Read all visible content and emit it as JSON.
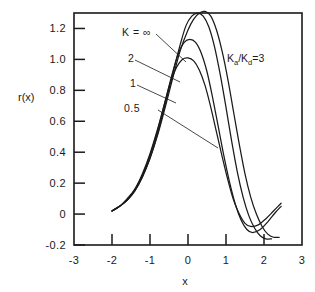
{
  "chart_data": {
    "type": "line",
    "title": "",
    "xlabel": "x",
    "ylabel": "r(x)",
    "xlim": [
      -3,
      3
    ],
    "ylim": [
      -0.2,
      1.3
    ],
    "grid": false,
    "legend_position": "inline-annotations",
    "x_ticks": [
      "-3",
      "-2",
      "-1",
      "0",
      "1",
      "2",
      "3"
    ],
    "x_tick_values": [
      -3,
      -2,
      -1,
      0,
      1,
      2,
      3
    ],
    "y_ticks": [
      "1.2",
      "1.0",
      "0.8",
      "0.6",
      "0.4",
      "0.2",
      "0",
      "-0.2"
    ],
    "y_tick_values": [
      1.2,
      1.0,
      0.8,
      0.6,
      0.4,
      0.2,
      0,
      -0.2
    ],
    "annotations": [
      {
        "name": "ratio",
        "text": "Ka/Kd =3",
        "x": 1.55,
        "y": 1.03
      }
    ],
    "series": [
      {
        "name": "K = ∞",
        "label": "K = ∞",
        "points": [
          [
            -2.0,
            0.02
          ],
          [
            -1.8,
            0.05
          ],
          [
            -1.6,
            0.09
          ],
          [
            -1.4,
            0.15
          ],
          [
            -1.2,
            0.24
          ],
          [
            -1.0,
            0.36
          ],
          [
            -0.8,
            0.51
          ],
          [
            -0.6,
            0.69
          ],
          [
            -0.4,
            0.88
          ],
          [
            -0.2,
            1.06
          ],
          [
            0.0,
            1.19
          ],
          [
            0.15,
            1.26
          ],
          [
            0.3,
            1.3
          ],
          [
            0.45,
            1.31
          ],
          [
            0.6,
            1.28
          ],
          [
            0.75,
            1.19
          ],
          [
            0.9,
            1.05
          ],
          [
            1.05,
            0.87
          ],
          [
            1.2,
            0.66
          ],
          [
            1.35,
            0.45
          ],
          [
            1.5,
            0.26
          ],
          [
            1.65,
            0.11
          ],
          [
            1.8,
            0.0
          ],
          [
            1.95,
            -0.08
          ],
          [
            2.1,
            -0.13
          ],
          [
            2.25,
            -0.15
          ],
          [
            2.4,
            -0.15
          ]
        ]
      },
      {
        "name": "K = 2",
        "label": "2",
        "points": [
          [
            -2.0,
            0.02
          ],
          [
            -1.8,
            0.05
          ],
          [
            -1.6,
            0.09
          ],
          [
            -1.4,
            0.15
          ],
          [
            -1.2,
            0.24
          ],
          [
            -1.0,
            0.36
          ],
          [
            -0.8,
            0.52
          ],
          [
            -0.6,
            0.71
          ],
          [
            -0.4,
            0.91
          ],
          [
            -0.2,
            1.1
          ],
          [
            -0.05,
            1.22
          ],
          [
            0.1,
            1.28
          ],
          [
            0.25,
            1.3
          ],
          [
            0.4,
            1.28
          ],
          [
            0.55,
            1.21
          ],
          [
            0.7,
            1.08
          ],
          [
            0.85,
            0.9
          ],
          [
            1.0,
            0.69
          ],
          [
            1.15,
            0.47
          ],
          [
            1.3,
            0.27
          ],
          [
            1.45,
            0.11
          ],
          [
            1.6,
            -0.01
          ],
          [
            1.75,
            -0.09
          ],
          [
            1.9,
            -0.14
          ],
          [
            2.05,
            -0.16
          ],
          [
            2.2,
            -0.16
          ]
        ]
      },
      {
        "name": "K = 1",
        "label": "1",
        "points": [
          [
            -2.0,
            0.02
          ],
          [
            -1.8,
            0.05
          ],
          [
            -1.6,
            0.09
          ],
          [
            -1.4,
            0.16
          ],
          [
            -1.2,
            0.25
          ],
          [
            -1.0,
            0.38
          ],
          [
            -0.8,
            0.54
          ],
          [
            -0.6,
            0.73
          ],
          [
            -0.4,
            0.92
          ],
          [
            -0.25,
            1.04
          ],
          [
            -0.1,
            1.11
          ],
          [
            0.05,
            1.13
          ],
          [
            0.2,
            1.11
          ],
          [
            0.35,
            1.04
          ],
          [
            0.5,
            0.92
          ],
          [
            0.65,
            0.75
          ],
          [
            0.8,
            0.56
          ],
          [
            0.95,
            0.37
          ],
          [
            1.1,
            0.2
          ],
          [
            1.25,
            0.06
          ],
          [
            1.4,
            -0.04
          ],
          [
            1.55,
            -0.1
          ],
          [
            1.7,
            -0.12
          ],
          [
            1.9,
            -0.1
          ],
          [
            2.1,
            -0.05
          ],
          [
            2.3,
            0.01
          ],
          [
            2.45,
            0.05
          ]
        ]
      },
      {
        "name": "K = 0.5",
        "label": "0.5",
        "points": [
          [
            -2.0,
            0.02
          ],
          [
            -1.8,
            0.05
          ],
          [
            -1.6,
            0.1
          ],
          [
            -1.4,
            0.16
          ],
          [
            -1.2,
            0.26
          ],
          [
            -1.0,
            0.39
          ],
          [
            -0.8,
            0.55
          ],
          [
            -0.6,
            0.73
          ],
          [
            -0.45,
            0.86
          ],
          [
            -0.3,
            0.95
          ],
          [
            -0.15,
            1.0
          ],
          [
            0.0,
            1.01
          ],
          [
            0.15,
            0.99
          ],
          [
            0.3,
            0.93
          ],
          [
            0.45,
            0.83
          ],
          [
            0.6,
            0.69
          ],
          [
            0.75,
            0.53
          ],
          [
            0.9,
            0.37
          ],
          [
            1.05,
            0.22
          ],
          [
            1.2,
            0.09
          ],
          [
            1.35,
            0.0
          ],
          [
            1.5,
            -0.06
          ],
          [
            1.65,
            -0.08
          ],
          [
            1.85,
            -0.07
          ],
          [
            2.05,
            -0.03
          ],
          [
            2.25,
            0.02
          ],
          [
            2.45,
            0.07
          ]
        ]
      }
    ],
    "series_labels": [
      {
        "key": "k-infinity",
        "text": "K = ∞",
        "x": 122,
        "y": 32,
        "leader_to_x": 186,
        "leader_to_y": 62
      },
      {
        "key": "k-2",
        "text": "2",
        "x": 128,
        "y": 58,
        "leader_to_x": 180,
        "leader_to_y": 82
      },
      {
        "key": "k-1",
        "text": "1",
        "x": 130,
        "y": 83,
        "leader_to_x": 176,
        "leader_to_y": 103
      },
      {
        "key": "k-0.5",
        "text": "0.5",
        "x": 124,
        "y": 108,
        "leader_to_x": 218,
        "leader_to_y": 148
      }
    ]
  }
}
